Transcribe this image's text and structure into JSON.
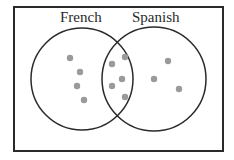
{
  "diagram": {
    "type": "venn",
    "sets": [
      {
        "label": "French",
        "cx": 82,
        "cy": 79,
        "r": 51
      },
      {
        "label": "Spanish",
        "cx": 154,
        "cy": 79,
        "r": 52
      }
    ],
    "regions": {
      "french_only": {
        "count": 4,
        "points": [
          [
            70,
            58
          ],
          [
            80,
            72
          ],
          [
            77,
            86
          ],
          [
            84,
            100
          ]
        ]
      },
      "both": {
        "count": 5,
        "points": [
          [
            112,
            64
          ],
          [
            125,
            57
          ],
          [
            122,
            79
          ],
          [
            112,
            86
          ],
          [
            125,
            97
          ]
        ]
      },
      "spanish_only": {
        "count": 3,
        "points": [
          [
            168,
            61
          ],
          [
            154,
            79
          ],
          [
            179,
            89
          ]
        ]
      }
    },
    "colors": {
      "outline": "#2a2a2a",
      "dot": "#9a9a9a",
      "background": "#ffffff"
    }
  }
}
